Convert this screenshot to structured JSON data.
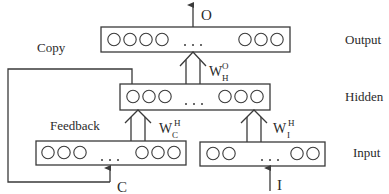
{
  "diagram": {
    "type": "elman-recurrent-network",
    "layers": {
      "output": {
        "label": "Output",
        "left_nodes": 4,
        "right_nodes": 3,
        "ellipsis": "..."
      },
      "hidden": {
        "label": "Hidden",
        "left_nodes": 3,
        "right_nodes": 3,
        "ellipsis": "..."
      },
      "context": {
        "left_nodes": 3,
        "right_nodes": 3,
        "ellipsis": "..."
      },
      "input": {
        "label": "Input",
        "left_nodes": 2,
        "right_nodes": 2,
        "ellipsis": "..."
      }
    },
    "signals": {
      "output": "O",
      "context": "C",
      "input": "I"
    },
    "weights": {
      "hidden_to_output": {
        "base": "W",
        "sup": "O",
        "sub": "H"
      },
      "context_to_hidden": {
        "base": "W",
        "sup": "H",
        "sub": "C"
      },
      "input_to_hidden": {
        "base": "W",
        "sup": "H",
        "sub": "I"
      }
    },
    "annotations": {
      "copy": "Copy",
      "feedback": "Feedback"
    },
    "colors": {
      "stroke": "#3a3a3a",
      "text": "#2a2a2a",
      "background": "#ffffff"
    }
  }
}
